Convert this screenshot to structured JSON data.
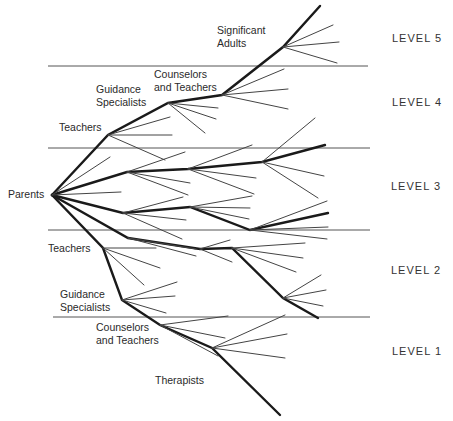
{
  "diagram": {
    "type": "branching-tree",
    "root_label": "Parents",
    "node_labels": {
      "significant_adults": "Significant\nAdults",
      "counselors_upper": "Counselors\nand Teachers",
      "guidance_upper": "Guidance\nSpecialists",
      "teachers_upper": "Teachers",
      "parents": "Parents",
      "teachers_lower": "Teachers",
      "guidance_lower": "Guidance\nSpecialists",
      "counselors_lower": "Counselors\nand Teachers",
      "therapists": "Therapists"
    },
    "levels": [
      "LEVEL 5",
      "LEVEL 4",
      "LEVEL 3",
      "LEVEL 2",
      "LEVEL 1"
    ],
    "colors": {
      "line": "#1a1a1a",
      "text": "#2a2a2a",
      "background": "#ffffff"
    }
  }
}
